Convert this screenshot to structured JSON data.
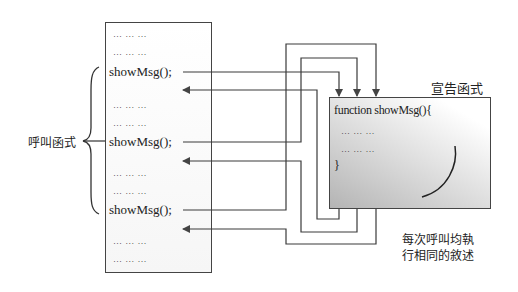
{
  "caller": {
    "label": "呼叫函式",
    "lines": [
      {
        "text": "… … …",
        "type": "dots",
        "y": 29
      },
      {
        "text": "… … …",
        "type": "dots",
        "y": 47
      },
      {
        "text": "showMsg();",
        "type": "call",
        "y": 64
      },
      {
        "text": "… … …",
        "type": "dots",
        "y": 100
      },
      {
        "text": "… … …",
        "type": "dots",
        "y": 118
      },
      {
        "text": "showMsg();",
        "type": "call",
        "y": 134
      },
      {
        "text": "… … …",
        "type": "dots",
        "y": 168
      },
      {
        "text": "… … …",
        "type": "dots",
        "y": 186
      },
      {
        "text": "showMsg();",
        "type": "call",
        "y": 202
      },
      {
        "text": "… … …",
        "type": "dots",
        "y": 236
      },
      {
        "text": "… … …",
        "type": "dots",
        "y": 254
      }
    ]
  },
  "callee": {
    "title": "宣告函式",
    "signature": "function showMsg(){",
    "body": [
      "… … …",
      "… … …"
    ],
    "closing": "}"
  },
  "annotation": {
    "line1": "每次呼叫均執",
    "line2": "行相同的敘述"
  },
  "colors": {
    "stroke": "#3a3a3a",
    "box_border": "#444444",
    "gradient_dark": "#b4b4b4"
  }
}
